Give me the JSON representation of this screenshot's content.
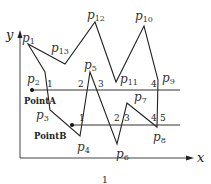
{
  "diagram": {
    "axes": {
      "x_label": "x",
      "y_label": "y"
    },
    "caption": "1",
    "polygon_vertices": [
      {
        "name": "p1",
        "x": 28,
        "y": 44
      },
      {
        "name": "p2",
        "x": 45,
        "y": 72
      },
      {
        "name": "p3",
        "x": 50,
        "y": 110
      },
      {
        "name": "p4",
        "x": 80,
        "y": 136
      },
      {
        "name": "p5",
        "x": 90,
        "y": 72
      },
      {
        "name": "p6",
        "x": 117,
        "y": 144
      },
      {
        "name": "p7",
        "x": 127,
        "y": 103
      },
      {
        "name": "p8",
        "x": 157,
        "y": 127
      },
      {
        "name": "p9",
        "x": 158,
        "y": 80
      },
      {
        "name": "p10",
        "x": 144,
        "y": 26
      },
      {
        "name": "p11",
        "x": 116,
        "y": 82
      },
      {
        "name": "p12",
        "x": 95,
        "y": 22
      },
      {
        "name": "p13",
        "x": 65,
        "y": 64
      }
    ],
    "vertex_labels": [
      {
        "base": "p",
        "sub": "1",
        "x": 22,
        "y": 42
      },
      {
        "base": "p",
        "sub": "2",
        "x": 27,
        "y": 83
      },
      {
        "base": "p",
        "sub": "3",
        "x": 36,
        "y": 119
      },
      {
        "base": "p",
        "sub": "4",
        "x": 77,
        "y": 151
      },
      {
        "base": "p",
        "sub": "5",
        "x": 84,
        "y": 69
      },
      {
        "base": "p",
        "sub": "6",
        "x": 116,
        "y": 158
      },
      {
        "base": "p",
        "sub": "7",
        "x": 134,
        "y": 101
      },
      {
        "base": "p",
        "sub": "8",
        "x": 153,
        "y": 141
      },
      {
        "base": "p",
        "sub": "9",
        "x": 162,
        "y": 82
      },
      {
        "base": "p",
        "sub": "10",
        "x": 135,
        "y": 20
      },
      {
        "base": "p",
        "sub": "11",
        "x": 120,
        "y": 83
      },
      {
        "base": "p",
        "sub": "12",
        "x": 87,
        "y": 19
      },
      {
        "base": "p",
        "sub": "13",
        "x": 51,
        "y": 52
      }
    ],
    "scan_lines": [
      {
        "name": "PointA",
        "label": "PointA",
        "y": 90,
        "x_start": 32,
        "x_end": 180,
        "label_x": 24,
        "label_y": 104,
        "intersections": [
          "1",
          "2",
          "3",
          "4"
        ],
        "intersection_labels": [
          {
            "text": "1",
            "x": 47,
            "y": 87
          },
          {
            "text": "2",
            "x": 78,
            "y": 87
          },
          {
            "text": "3",
            "x": 98,
            "y": 87
          },
          {
            "text": "4",
            "x": 151,
            "y": 87
          }
        ]
      },
      {
        "name": "PointB",
        "label": "PointB",
        "y": 125,
        "x_start": 72,
        "x_end": 180,
        "label_x": 34,
        "label_y": 139,
        "intersections": [
          "1",
          "2",
          "3",
          "4",
          "5"
        ],
        "intersection_labels": [
          {
            "text": "1",
            "x": 79,
            "y": 121
          },
          {
            "text": "2",
            "x": 114,
            "y": 121
          },
          {
            "text": "3",
            "x": 124,
            "y": 121
          },
          {
            "text": "4",
            "x": 151,
            "y": 121
          },
          {
            "text": "5",
            "x": 160,
            "y": 121
          }
        ]
      }
    ]
  }
}
